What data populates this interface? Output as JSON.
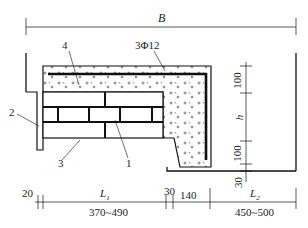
{
  "diagram": {
    "type": "structural cross-section",
    "overall_width_label": "B",
    "rebar_label": "3Φ12",
    "callouts": [
      "1",
      "2",
      "3",
      "4"
    ],
    "vertical_dims": [
      "100",
      "h",
      "100",
      "30"
    ],
    "bottom_dims": {
      "top_row": [
        "20",
        "L1",
        "30",
        "140",
        "L2"
      ],
      "bottom_row": [
        "370~490",
        "450~500"
      ]
    }
  },
  "labels": {
    "B": "B",
    "rebar": "3Φ12",
    "c1": "1",
    "c2": "2",
    "c3": "3",
    "c4": "4",
    "v100a": "100",
    "vh": "h",
    "v100b": "100",
    "v30": "30",
    "d20": "20",
    "L1": "L",
    "L1sub": "1",
    "d30": "30",
    "d140": "140",
    "L2": "L",
    "L2sub": "2",
    "r1": "370~490",
    "r2": "450~500"
  }
}
